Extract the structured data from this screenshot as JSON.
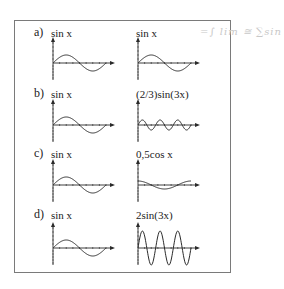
{
  "figure": {
    "handwritten_note": "=∫ lim ≅ ∑sin",
    "rows": [
      {
        "letter": "a)",
        "left_label": "sin x",
        "right_label": "sin x",
        "axis_y": 63,
        "label_y": 28,
        "left": {
          "amp": 8,
          "cycles": 1,
          "fn": "sin"
        },
        "right": {
          "amp": 8,
          "cycles": 1,
          "fn": "sin"
        }
      },
      {
        "letter": "b)",
        "left_label": "sin x",
        "right_label": "(2/3)sin(3x)",
        "axis_y": 125,
        "label_y": 87,
        "left": {
          "amp": 8,
          "cycles": 1,
          "fn": "sin"
        },
        "right": {
          "amp": 5,
          "cycles": 3,
          "fn": "sin"
        }
      },
      {
        "letter": "c)",
        "left_label": "sin x",
        "right_label": "0,5cos x",
        "axis_y": 185,
        "label_y": 147,
        "left": {
          "amp": 8,
          "cycles": 1,
          "fn": "sin"
        },
        "right": {
          "amp": 4,
          "cycles": 1,
          "fn": "cos"
        }
      },
      {
        "letter": "d)",
        "left_label": "sin x",
        "right_label": "2sin(3x)",
        "axis_y": 248,
        "label_y": 208,
        "left": {
          "amp": 8,
          "cycles": 1,
          "fn": "sin"
        },
        "right": {
          "amp": 17,
          "cycles": 3,
          "fn": "sin"
        }
      }
    ]
  },
  "colors": {
    "ink": "#2a2a2a",
    "frame": "#7a7a7a"
  }
}
